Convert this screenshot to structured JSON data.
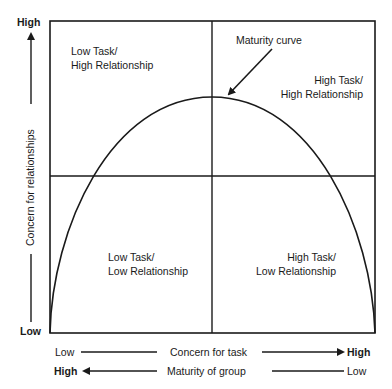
{
  "diagram": {
    "y_axis": {
      "label": "Concern for relationships",
      "high": "High",
      "low": "Low"
    },
    "x_axes": [
      {
        "label": "Concern for task",
        "left": "Low",
        "right": "High",
        "arrow": "right"
      },
      {
        "label": "Maturity of group",
        "left": "High",
        "right": "Low",
        "arrow": "left"
      }
    ],
    "quadrants": {
      "top_left": {
        "line1": "Low Task/",
        "line2": "High Relationship"
      },
      "top_right": {
        "line1": "High Task/",
        "line2": "High Relationship"
      },
      "bottom_left": {
        "line1": "Low Task/",
        "line2": "Low Relationship"
      },
      "bottom_right": {
        "line1": "High Task/",
        "line2": "Low Relationship"
      }
    },
    "annotation": "Maturity curve",
    "colors": {
      "line": "#1a1a1a",
      "background": "#ffffff"
    }
  }
}
